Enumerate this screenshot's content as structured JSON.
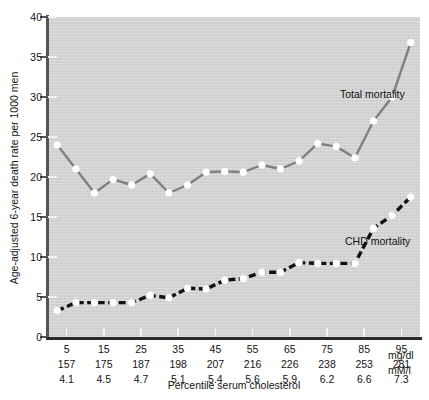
{
  "chart_data": {
    "type": "line",
    "title": "",
    "xlabel": "Percentile serum cholesterol",
    "ylabel": "Age-adjusted 6-year death rate per 1000 men",
    "ylim": [
      0,
      40
    ],
    "yticks": [
      0,
      5,
      10,
      15,
      20,
      25,
      30,
      35,
      40
    ],
    "xlim": [
      0,
      100
    ],
    "grid": false,
    "legend_position": "inline-annotation",
    "x": [
      2.5,
      7.5,
      12.5,
      17.5,
      22.5,
      27.5,
      32.5,
      37.5,
      42.5,
      47.5,
      52.5,
      57.5,
      62.5,
      67.5,
      72.5,
      77.5,
      82.5,
      87.5,
      92.5,
      97.5
    ],
    "xtick_labels": {
      "percentile": [
        "5",
        "15",
        "25",
        "35",
        "45",
        "55",
        "65",
        "75",
        "85",
        "95"
      ],
      "mg_dl": [
        "157",
        "175",
        "187",
        "198",
        "207",
        "216",
        "226",
        "238",
        "253",
        "281"
      ],
      "mmol_l": [
        "4.1",
        "4.5",
        "4.7",
        "5.1",
        "5.4",
        "5.6",
        "5.9",
        "6.2",
        "6.6",
        "7.3"
      ],
      "xtick_positions": [
        5,
        15,
        25,
        35,
        45,
        55,
        65,
        75,
        85,
        95
      ],
      "unit_row_2": "mg/dl",
      "unit_row_3": "mM/l"
    },
    "series": [
      {
        "name": "Total mortality",
        "label": "Total mortality",
        "color": "#808080",
        "style": "solid",
        "marker": "circle-white",
        "values": [
          24.0,
          21.0,
          18.0,
          19.7,
          19.0,
          20.4,
          18.0,
          19.0,
          20.6,
          20.7,
          20.6,
          21.5,
          21.0,
          22.0,
          24.2,
          23.8,
          22.4,
          27.0,
          30.0,
          36.8
        ]
      },
      {
        "name": "CHD mortality",
        "label": "CHD mortality",
        "color": "#111111",
        "style": "dashed",
        "marker": "circle-white",
        "values": [
          3.3,
          4.3,
          4.3,
          4.3,
          4.3,
          5.2,
          4.9,
          6.1,
          6.0,
          7.1,
          7.3,
          8.1,
          8.1,
          9.3,
          9.2,
          9.2,
          9.2,
          13.6,
          15.2,
          17.5
        ]
      }
    ]
  },
  "colors": {
    "plot_background": "#d2d2d2",
    "page_background": "#ffffff",
    "axis": "#555555",
    "total_mortality": "#808080",
    "chd_mortality": "#111111",
    "marker_fill": "#ffffff"
  }
}
